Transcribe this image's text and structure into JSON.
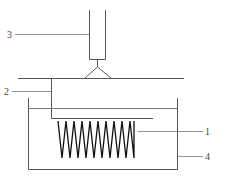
{
  "diagram": {
    "type": "apparatus-schematic",
    "labels": {
      "spring": "1",
      "holder": "2",
      "tube": "3",
      "container": "4"
    },
    "colors": {
      "line": "#555555",
      "spring": "#111111",
      "background": "#ffffff"
    },
    "spring_coils": 10
  }
}
